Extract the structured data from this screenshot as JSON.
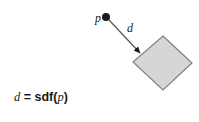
{
  "figure": {
    "background_color": "#ffffff",
    "stroke_color": "#1a1a1a",
    "shape": {
      "name": "rotated-square",
      "fill_color": "#d6d6d6",
      "border_color": "#808080",
      "rotation_degrees": 45,
      "corners": [
        {
          "x": 163,
          "y": 36
        },
        {
          "x": 192,
          "y": 63
        },
        {
          "x": 163,
          "y": 90
        },
        {
          "x": 133,
          "y": 62
        }
      ]
    },
    "point": {
      "label": "p",
      "label_x": 95,
      "label_y": 22,
      "dot_x": 106,
      "dot_y": 17,
      "dot_radius": 4,
      "dot_color": "#1a1a1a"
    },
    "distance_arrow": {
      "label": "d",
      "label_x": 127,
      "label_y": 32,
      "from_x": 109,
      "from_y": 20,
      "to_x": 140,
      "to_y": 53,
      "line_color": "#555555",
      "line_width": 1.2,
      "arrowhead_color": "#1a1a1a"
    },
    "formula": {
      "x": 14,
      "y": 101,
      "lhs": "d",
      "equals": " = ",
      "function_name": "sdf",
      "open_paren": "(",
      "argument": "p",
      "close_paren": ")",
      "full_text": "d = sdf(p)"
    }
  }
}
